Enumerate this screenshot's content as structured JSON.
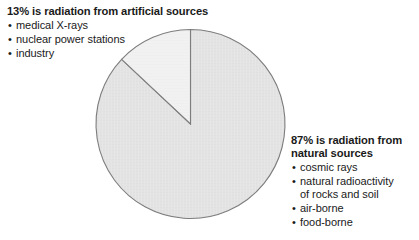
{
  "figure": {
    "background_color": "#ffffff",
    "text_color": "#1a1a1a"
  },
  "chart_data": {
    "type": "pie",
    "title": "",
    "subtitle": "",
    "xlabel": "",
    "ylabel": "",
    "grid": false,
    "legend_position": "annotations-outside",
    "start_angle_deg": 90,
    "direction": "counterclockwise",
    "categories": [
      "artificial sources",
      "natural sources"
    ],
    "values": [
      13,
      87
    ],
    "units": "percent",
    "slices": [
      {
        "label": "artificial sources",
        "value": 13,
        "value_label": "13%",
        "color": "#f1f1f1",
        "edge_color": "#7d7d7d",
        "sweep_deg": 46.8
      },
      {
        "label": "natural sources",
        "value": 87,
        "value_label": "87%",
        "color": "#e3e3e3",
        "edge_color": "#7d7d7d",
        "sweep_deg": 313.2
      }
    ],
    "geometry": {
      "center_x": 190.5,
      "center_y": 124,
      "radius": 94.5
    },
    "annotations": [
      {
        "heading": "13% is radiation from artificial sources",
        "items": [
          "medical X-rays",
          "nuclear power stations",
          "industry"
        ]
      },
      {
        "heading": "87% is radiation from natural sources",
        "items": [
          "cosmic rays",
          "natural radioactivity of rocks and soil",
          "air-borne",
          "food-borne"
        ]
      }
    ]
  },
  "annotations": {
    "artificial": {
      "heading": "13% is radiation from artificial sources",
      "bullet_glyph": "•",
      "items": [
        {
          "label": "medical X-rays"
        },
        {
          "label": "nuclear power stations"
        },
        {
          "label": "industry"
        }
      ]
    },
    "natural": {
      "heading": "87% is radiation from\nnatural sources",
      "bullet_glyph": "•",
      "items": [
        {
          "label": "cosmic rays"
        },
        {
          "label": "natural radioactivity\nof rocks and soil"
        },
        {
          "label": "air-borne"
        },
        {
          "label": "food-borne"
        }
      ]
    }
  }
}
